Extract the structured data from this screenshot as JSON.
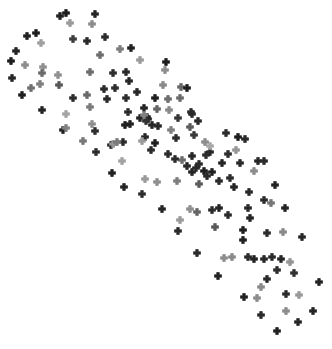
{
  "figure": {
    "background_color": "#ffffff",
    "width": 332,
    "height": 349,
    "has_axes": false,
    "has_title": false,
    "has_legend": false,
    "has_gridlines": false,
    "has_tick_labels": false
  },
  "marker": {
    "shape": "plus-cross",
    "name": "plus-marker",
    "size_px": 7,
    "arm_thickness_px": 2.6,
    "colormap": "greys"
  },
  "chart_data": {
    "type": "scatter",
    "title": "",
    "subtitle": "",
    "xlabel": "",
    "ylabel": "",
    "xlim": [
      0,
      332
    ],
    "ylim": [
      0,
      349
    ],
    "grid": false,
    "legend": false,
    "axes_visible": false,
    "marker_style": "plus",
    "color_scale_min": "#b4b4b4",
    "color_scale_max": "#1a1a1a",
    "n_points": 163,
    "series": [
      {
        "name": "points",
        "points": [
          {
            "x": 66,
            "y": 13,
            "c": "#1d1d1d"
          },
          {
            "x": 60,
            "y": 16,
            "c": "#222222"
          },
          {
            "x": 95,
            "y": 14,
            "c": "#252525"
          },
          {
            "x": 70,
            "y": 23,
            "c": "#9a9a9a"
          },
          {
            "x": 92,
            "y": 24,
            "c": "#8c8c8c"
          },
          {
            "x": 36,
            "y": 33,
            "c": "#1e1e1e"
          },
          {
            "x": 27,
            "y": 36,
            "c": "#222222"
          },
          {
            "x": 41,
            "y": 43,
            "c": "#a0a0a0"
          },
          {
            "x": 73,
            "y": 39,
            "c": "#3d3d3d"
          },
          {
            "x": 87,
            "y": 41,
            "c": "#2a2a2a"
          },
          {
            "x": 105,
            "y": 37,
            "c": "#2c2c2c"
          },
          {
            "x": 16,
            "y": 51,
            "c": "#242424"
          },
          {
            "x": 11,
            "y": 61,
            "c": "#1d1d1d"
          },
          {
            "x": 120,
            "y": 49,
            "c": "#7e7e7e"
          },
          {
            "x": 131,
            "y": 48,
            "c": "#212121"
          },
          {
            "x": 100,
            "y": 55,
            "c": "#6e6e6e"
          },
          {
            "x": 140,
            "y": 60,
            "c": "#9b9b9b"
          },
          {
            "x": 25,
            "y": 65,
            "c": "#8e8e8e"
          },
          {
            "x": 43,
            "y": 67,
            "c": "#8f8f8f"
          },
          {
            "x": 12,
            "y": 78,
            "c": "#272727"
          },
          {
            "x": 40,
            "y": 84,
            "c": "#808080"
          },
          {
            "x": 42,
            "y": 73,
            "c": "#6a6a6a"
          },
          {
            "x": 90,
            "y": 72,
            "c": "#6d6d6d"
          },
          {
            "x": 166,
            "y": 62,
            "c": "#1c1c1c"
          },
          {
            "x": 165,
            "y": 70,
            "c": "#8e8e8e"
          },
          {
            "x": 22,
            "y": 95,
            "c": "#1f1f1f"
          },
          {
            "x": 31,
            "y": 88,
            "c": "#707070"
          },
          {
            "x": 59,
            "y": 85,
            "c": "#585858"
          },
          {
            "x": 113,
            "y": 73,
            "c": "#2e2e2e"
          },
          {
            "x": 126,
            "y": 72,
            "c": "#2a2a2a"
          },
          {
            "x": 129,
            "y": 81,
            "c": "#272727"
          },
          {
            "x": 58,
            "y": 75,
            "c": "#919191"
          },
          {
            "x": 87,
            "y": 95,
            "c": "#6a6a6a"
          },
          {
            "x": 104,
            "y": 89,
            "c": "#2b2b2b"
          },
          {
            "x": 115,
            "y": 88,
            "c": "#2d2d2d"
          },
          {
            "x": 126,
            "y": 98,
            "c": "#2c2c2c"
          },
          {
            "x": 163,
            "y": 85,
            "c": "#8a8a8a"
          },
          {
            "x": 181,
            "y": 87,
            "c": "#686868"
          },
          {
            "x": 187,
            "y": 88,
            "c": "#1f1f1f"
          },
          {
            "x": 155,
            "y": 98,
            "c": "#1e1e1e"
          },
          {
            "x": 168,
            "y": 99,
            "c": "#6e6e6e"
          },
          {
            "x": 107,
            "y": 99,
            "c": "#2a2a2a"
          },
          {
            "x": 90,
            "y": 107,
            "c": "#7b7b7b"
          },
          {
            "x": 144,
            "y": 108,
            "c": "#242424"
          },
          {
            "x": 42,
            "y": 110,
            "c": "#242424"
          },
          {
            "x": 66,
            "y": 114,
            "c": "#a4a4a4"
          },
          {
            "x": 92,
            "y": 124,
            "c": "#8f8f8f"
          },
          {
            "x": 128,
            "y": 112,
            "c": "#2c2c2c"
          },
          {
            "x": 147,
            "y": 117,
            "c": "#2d2d2d"
          },
          {
            "x": 152,
            "y": 125,
            "c": "#252525"
          },
          {
            "x": 125,
            "y": 125,
            "c": "#202020"
          },
          {
            "x": 157,
            "y": 109,
            "c": "#666666"
          },
          {
            "x": 169,
            "y": 110,
            "c": "#8a8a8a"
          },
          {
            "x": 192,
            "y": 114,
            "c": "#2d2d2d"
          },
          {
            "x": 63,
            "y": 130,
            "c": "#232323"
          },
          {
            "x": 95,
            "y": 131,
            "c": "#2e2e2e"
          },
          {
            "x": 140,
            "y": 118,
            "c": "#242424"
          },
          {
            "x": 178,
            "y": 118,
            "c": "#383838"
          },
          {
            "x": 180,
            "y": 98,
            "c": "#6b6b6b"
          },
          {
            "x": 123,
            "y": 142,
            "c": "#2b2b2b"
          },
          {
            "x": 145,
            "y": 137,
            "c": "#282828"
          },
          {
            "x": 158,
            "y": 126,
            "c": "#272727"
          },
          {
            "x": 148,
            "y": 119,
            "c": "#282828"
          },
          {
            "x": 155,
            "y": 143,
            "c": "#1f1f1f"
          },
          {
            "x": 190,
            "y": 127,
            "c": "#5d5d5d"
          },
          {
            "x": 191,
            "y": 112,
            "c": "#2b2b2b"
          },
          {
            "x": 176,
            "y": 138,
            "c": "#2d2d2d"
          },
          {
            "x": 66,
            "y": 128,
            "c": "#818181"
          },
          {
            "x": 146,
            "y": 121,
            "c": "#323232"
          },
          {
            "x": 238,
            "y": 137,
            "c": "#1d1d1d"
          },
          {
            "x": 194,
            "y": 135,
            "c": "#3a3a3a"
          },
          {
            "x": 130,
            "y": 124,
            "c": "#222222"
          },
          {
            "x": 83,
            "y": 141,
            "c": "#797979"
          },
          {
            "x": 111,
            "y": 145,
            "c": "#272727"
          },
          {
            "x": 245,
            "y": 139,
            "c": "#2a2a2a"
          },
          {
            "x": 151,
            "y": 150,
            "c": "#2b2b2b"
          },
          {
            "x": 182,
            "y": 160,
            "c": "#6d6d6d"
          },
          {
            "x": 192,
            "y": 156,
            "c": "#272727"
          },
          {
            "x": 199,
            "y": 164,
            "c": "#2b2b2b"
          },
          {
            "x": 206,
            "y": 155,
            "c": "#2d2d2d"
          },
          {
            "x": 210,
            "y": 152,
            "c": "#282828"
          },
          {
            "x": 222,
            "y": 163,
            "c": "#252525"
          },
          {
            "x": 228,
            "y": 154,
            "c": "#2e2e2e"
          },
          {
            "x": 142,
            "y": 141,
            "c": "#9c9c9c"
          },
          {
            "x": 113,
            "y": 144,
            "c": "#959595"
          },
          {
            "x": 117,
            "y": 142,
            "c": "#7a7a7a"
          },
          {
            "x": 168,
            "y": 154,
            "c": "#2b2b2b"
          },
          {
            "x": 210,
            "y": 146,
            "c": "#a8a8a8"
          },
          {
            "x": 236,
            "y": 150,
            "c": "#969696"
          },
          {
            "x": 175,
            "y": 159,
            "c": "#2c2c2c"
          },
          {
            "x": 96,
            "y": 152,
            "c": "#2d2d2d"
          },
          {
            "x": 122,
            "y": 161,
            "c": "#a2a2a2"
          },
          {
            "x": 187,
            "y": 166,
            "c": "#2a2a2a"
          },
          {
            "x": 192,
            "y": 172,
            "c": "#252525"
          },
          {
            "x": 196,
            "y": 168,
            "c": "#292929"
          },
          {
            "x": 204,
            "y": 171,
            "c": "#1f1f1f"
          },
          {
            "x": 212,
            "y": 172,
            "c": "#212121"
          },
          {
            "x": 240,
            "y": 163,
            "c": "#2a2a2a"
          },
          {
            "x": 258,
            "y": 161,
            "c": "#272727"
          },
          {
            "x": 264,
            "y": 161,
            "c": "#2b2b2b"
          },
          {
            "x": 254,
            "y": 171,
            "c": "#8c8c8c"
          },
          {
            "x": 112,
            "y": 173,
            "c": "#212121"
          },
          {
            "x": 145,
            "y": 179,
            "c": "#9a9a9a"
          },
          {
            "x": 157,
            "y": 182,
            "c": "#8e8e8e"
          },
          {
            "x": 177,
            "y": 181,
            "c": "#7e7e7e"
          },
          {
            "x": 199,
            "y": 184,
            "c": "#5b5b5b"
          },
          {
            "x": 207,
            "y": 176,
            "c": "#2a2a2a"
          },
          {
            "x": 219,
            "y": 181,
            "c": "#2b2b2b"
          },
          {
            "x": 230,
            "y": 178,
            "c": "#2c2c2c"
          },
          {
            "x": 234,
            "y": 187,
            "c": "#252525"
          },
          {
            "x": 124,
            "y": 187,
            "c": "#252525"
          },
          {
            "x": 249,
            "y": 192,
            "c": "#2a2a2a"
          },
          {
            "x": 275,
            "y": 185,
            "c": "#232323"
          },
          {
            "x": 142,
            "y": 194,
            "c": "#2e2e2e"
          },
          {
            "x": 162,
            "y": 209,
            "c": "#242424"
          },
          {
            "x": 190,
            "y": 209,
            "c": "#8f8f8f"
          },
          {
            "x": 180,
            "y": 220,
            "c": "#9b9b9b"
          },
          {
            "x": 197,
            "y": 212,
            "c": "#656565"
          },
          {
            "x": 212,
            "y": 210,
            "c": "#2c2c2c"
          },
          {
            "x": 219,
            "y": 208,
            "c": "#252525"
          },
          {
            "x": 228,
            "y": 215,
            "c": "#2b2b2b"
          },
          {
            "x": 248,
            "y": 208,
            "c": "#2a2a2a"
          },
          {
            "x": 250,
            "y": 218,
            "c": "#242424"
          },
          {
            "x": 264,
            "y": 200,
            "c": "#2c2c2c"
          },
          {
            "x": 271,
            "y": 203,
            "c": "#767676"
          },
          {
            "x": 285,
            "y": 208,
            "c": "#242424"
          },
          {
            "x": 215,
            "y": 227,
            "c": "#585858"
          },
          {
            "x": 178,
            "y": 231,
            "c": "#2a2a2a"
          },
          {
            "x": 243,
            "y": 230,
            "c": "#1f1f1f"
          },
          {
            "x": 243,
            "y": 240,
            "c": "#222222"
          },
          {
            "x": 267,
            "y": 233,
            "c": "#2c2c2c"
          },
          {
            "x": 283,
            "y": 232,
            "c": "#8b8b8b"
          },
          {
            "x": 302,
            "y": 237,
            "c": "#282828"
          },
          {
            "x": 197,
            "y": 253,
            "c": "#2b2b2b"
          },
          {
            "x": 224,
            "y": 258,
            "c": "#8d8d8d"
          },
          {
            "x": 232,
            "y": 257,
            "c": "#8a8a8a"
          },
          {
            "x": 248,
            "y": 257,
            "c": "#2c2c2c"
          },
          {
            "x": 254,
            "y": 259,
            "c": "#242424"
          },
          {
            "x": 264,
            "y": 259,
            "c": "#292929"
          },
          {
            "x": 272,
            "y": 257,
            "c": "#2b2b2b"
          },
          {
            "x": 281,
            "y": 259,
            "c": "#262626"
          },
          {
            "x": 290,
            "y": 262,
            "c": "#949494"
          },
          {
            "x": 277,
            "y": 270,
            "c": "#2d2d2d"
          },
          {
            "x": 218,
            "y": 276,
            "c": "#222222"
          },
          {
            "x": 267,
            "y": 279,
            "c": "#2a2a2a"
          },
          {
            "x": 294,
            "y": 273,
            "c": "#313131"
          },
          {
            "x": 261,
            "y": 287,
            "c": "#8b8b8b"
          },
          {
            "x": 319,
            "y": 282,
            "c": "#232323"
          },
          {
            "x": 244,
            "y": 297,
            "c": "#222222"
          },
          {
            "x": 257,
            "y": 298,
            "c": "#8d8d8d"
          },
          {
            "x": 286,
            "y": 294,
            "c": "#2c2c2c"
          },
          {
            "x": 299,
            "y": 295,
            "c": "#999999"
          },
          {
            "x": 261,
            "y": 315,
            "c": "#2b2b2b"
          },
          {
            "x": 286,
            "y": 311,
            "c": "#8c8c8c"
          },
          {
            "x": 313,
            "y": 311,
            "c": "#242424"
          },
          {
            "x": 298,
            "y": 322,
            "c": "#262626"
          },
          {
            "x": 277,
            "y": 331,
            "c": "#212121"
          },
          {
            "x": 144,
            "y": 115,
            "c": "#828282"
          },
          {
            "x": 73,
            "y": 98,
            "c": "#2c2c2c"
          },
          {
            "x": 137,
            "y": 92,
            "c": "#272727"
          },
          {
            "x": 198,
            "y": 121,
            "c": "#2a2a2a"
          },
          {
            "x": 226,
            "y": 133,
            "c": "#2c2c2c"
          },
          {
            "x": 171,
            "y": 130,
            "c": "#808080"
          },
          {
            "x": 205,
            "y": 142,
            "c": "#8d8d8d"
          }
        ]
      }
    ]
  }
}
